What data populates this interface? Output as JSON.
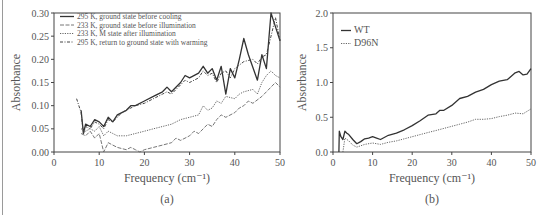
{
  "chart_data": [
    {
      "id": "a",
      "type": "line",
      "panel_label": "(a)",
      "title": "",
      "xlabel": "Frequency (cm⁻¹)",
      "ylabel": "Absorbance",
      "xlim": [
        0,
        50
      ],
      "ylim": [
        0,
        0.3
      ],
      "xticks": [
        "0",
        "10",
        "20",
        "30",
        "40",
        "50"
      ],
      "yticks": [
        "0.00",
        "0.05",
        "0.10",
        "0.15",
        "0.20",
        "0.25",
        "0.30"
      ],
      "grid": false,
      "legend_position": "upper left",
      "series": [
        {
          "name": "295 K, ground state before cooling",
          "style": "solid",
          "x": [
            6,
            6.5,
            7,
            8,
            9,
            10,
            11,
            12,
            13,
            14,
            15,
            16,
            17,
            18,
            20,
            22,
            24,
            25,
            26,
            28,
            29,
            30,
            32,
            33,
            34,
            35,
            36,
            37,
            38,
            39,
            40,
            41,
            42,
            43,
            45,
            46,
            47,
            48,
            49,
            50
          ],
          "values": [
            0.09,
            0.04,
            0.06,
            0.055,
            0.07,
            0.065,
            0.055,
            0.075,
            0.065,
            0.08,
            0.085,
            0.09,
            0.1,
            0.1,
            0.11,
            0.12,
            0.13,
            0.14,
            0.13,
            0.15,
            0.165,
            0.16,
            0.17,
            0.185,
            0.17,
            0.18,
            0.155,
            0.185,
            0.125,
            0.18,
            0.16,
            0.2,
            0.245,
            0.21,
            0.155,
            0.21,
            0.18,
            0.3,
            0.27,
            0.24
          ]
        },
        {
          "name": "233 K, ground state before illumination",
          "style": "dashed",
          "x": [
            6,
            7,
            8,
            9,
            10,
            11,
            12,
            13,
            14,
            16,
            17,
            18,
            19,
            20,
            22,
            24,
            26,
            27,
            28,
            30,
            31,
            32,
            33,
            34,
            35,
            36,
            37,
            38,
            40,
            41,
            42,
            43,
            44,
            46,
            47,
            48,
            49,
            50
          ],
          "values": [
            0.04,
            0.035,
            0.045,
            0.03,
            0.04,
            0.0,
            0.02,
            0.015,
            0.01,
            0.005,
            0.01,
            0.005,
            0.0,
            0.005,
            0.01,
            0.015,
            0.02,
            0.03,
            0.025,
            0.035,
            0.045,
            0.04,
            0.05,
            0.06,
            0.055,
            0.07,
            0.08,
            0.075,
            0.085,
            0.095,
            0.1,
            0.11,
            0.105,
            0.12,
            0.13,
            0.14,
            0.15,
            0.14
          ]
        },
        {
          "name": "233 K, M state after illumination",
          "style": "dotted",
          "x": [
            6,
            7,
            8,
            9,
            10,
            11,
            12,
            13,
            14,
            16,
            18,
            20,
            22,
            24,
            26,
            28,
            30,
            32,
            33,
            34,
            35,
            36,
            37,
            38,
            40,
            41,
            42,
            44,
            45,
            46,
            47,
            48,
            49,
            50
          ],
          "values": [
            0.05,
            0.045,
            0.05,
            0.045,
            0.055,
            0.035,
            0.045,
            0.04,
            0.035,
            0.035,
            0.04,
            0.045,
            0.05,
            0.055,
            0.06,
            0.07,
            0.075,
            0.08,
            0.1,
            0.09,
            0.095,
            0.11,
            0.105,
            0.12,
            0.115,
            0.125,
            0.13,
            0.135,
            0.125,
            0.15,
            0.165,
            0.175,
            0.165,
            0.16
          ]
        },
        {
          "name": "295 K, return to ground state with warming",
          "style": "dashdot",
          "x": [
            5,
            6,
            6.5,
            7,
            8,
            9,
            10,
            11,
            12,
            13,
            14,
            15,
            16,
            17,
            18,
            20,
            22,
            24,
            25,
            26,
            28,
            29,
            30,
            32,
            33,
            34,
            35,
            36,
            37,
            38,
            39,
            40,
            42,
            44,
            45,
            46,
            47,
            48,
            49,
            50
          ],
          "values": [
            0.115,
            0.085,
            0.04,
            0.055,
            0.05,
            0.065,
            0.06,
            0.05,
            0.07,
            0.065,
            0.075,
            0.085,
            0.09,
            0.095,
            0.1,
            0.105,
            0.115,
            0.125,
            0.13,
            0.125,
            0.145,
            0.155,
            0.15,
            0.16,
            0.175,
            0.165,
            0.17,
            0.15,
            0.17,
            0.175,
            0.16,
            0.18,
            0.195,
            0.2,
            0.19,
            0.205,
            0.21,
            0.25,
            0.29,
            0.24
          ]
        }
      ]
    },
    {
      "id": "b",
      "type": "line",
      "panel_label": "(b)",
      "title": "",
      "xlabel": "Frequency (cm⁻¹)",
      "ylabel": "Absorbance",
      "xlim": [
        0,
        50
      ],
      "ylim": [
        0,
        2.0
      ],
      "xticks": [
        "0",
        "10",
        "20",
        "30",
        "40",
        "50"
      ],
      "yticks": [
        "0.0",
        "0.5",
        "1.0",
        "1.5",
        "2.0"
      ],
      "grid": false,
      "legend_position": "upper left",
      "series": [
        {
          "name": "WT",
          "style": "solid",
          "x": [
            1.5,
            1.6,
            2.0,
            2.5,
            3.0,
            3.5,
            4.0,
            5.0,
            6.0,
            7.0,
            8.0,
            9.0,
            10.0,
            11.0,
            12.0,
            14.0,
            16.0,
            18.0,
            20.0,
            22.0,
            24.0,
            26.0,
            27.0,
            28.0,
            30.0,
            32.0,
            34.0,
            36.0,
            38.0,
            40.0,
            42.0,
            44.0,
            46.0,
            47.0,
            48.0,
            49.0,
            50.0
          ],
          "values": [
            0.0,
            0.3,
            0.22,
            0.18,
            0.3,
            0.27,
            0.25,
            0.18,
            0.12,
            0.15,
            0.19,
            0.2,
            0.22,
            0.2,
            0.18,
            0.24,
            0.27,
            0.32,
            0.38,
            0.45,
            0.53,
            0.55,
            0.6,
            0.6,
            0.67,
            0.77,
            0.8,
            0.86,
            0.9,
            0.97,
            1.02,
            1.04,
            1.14,
            1.16,
            1.11,
            1.12,
            1.2
          ]
        },
        {
          "name": "D96N",
          "style": "dotted",
          "x": [
            2.5,
            3.0,
            3.5,
            4.0,
            5.0,
            6.0,
            8.0,
            10.0,
            12.0,
            14.0,
            16.0,
            18.0,
            20.0,
            22.0,
            24.0,
            26.0,
            28.0,
            30.0,
            32.0,
            34.0,
            36.0,
            38.0,
            40.0,
            42.0,
            44.0,
            46.0,
            48.0,
            50.0
          ],
          "values": [
            0.0,
            0.2,
            0.18,
            0.16,
            0.1,
            0.07,
            0.11,
            0.13,
            0.11,
            0.14,
            0.16,
            0.19,
            0.22,
            0.25,
            0.28,
            0.31,
            0.34,
            0.37,
            0.4,
            0.43,
            0.47,
            0.47,
            0.48,
            0.51,
            0.53,
            0.56,
            0.55,
            0.62
          ]
        }
      ]
    }
  ]
}
